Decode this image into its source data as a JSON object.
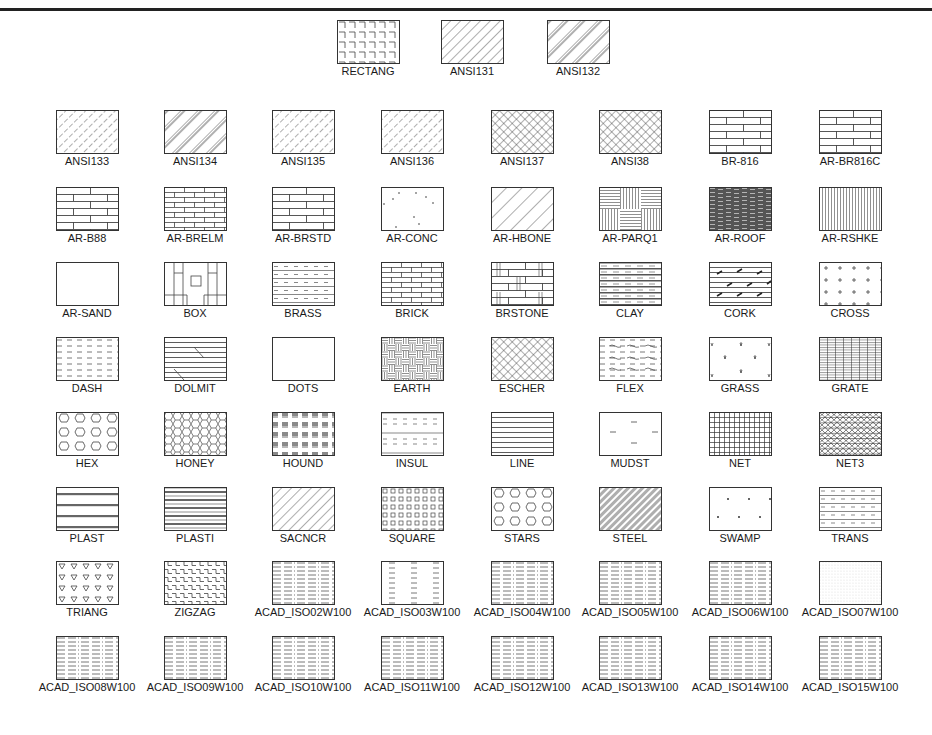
{
  "border_color": "#222222",
  "rows": [
    {
      "y": 20,
      "cells": [
        {
          "x": 337,
          "name": "RECTANG",
          "pattern": "rectang"
        },
        {
          "x": 441,
          "name": "ANSI131",
          "pattern": "ansi131"
        },
        {
          "x": 547,
          "name": "ANSI132",
          "pattern": "ansi132"
        }
      ]
    },
    {
      "y": 110,
      "cells": [
        {
          "name": "ANSI133",
          "pattern": "ansi133"
        },
        {
          "name": "ANSI134",
          "pattern": "ansi134"
        },
        {
          "name": "ANSI135",
          "pattern": "ansi135"
        },
        {
          "name": "ANSI136",
          "pattern": "ansi136"
        },
        {
          "name": "ANSI137",
          "pattern": "ansi137"
        },
        {
          "name": "ANSI38",
          "pattern": "ansi38"
        },
        {
          "name": "BR-816",
          "pattern": "br816"
        },
        {
          "name": "AR-BR816C",
          "pattern": "arbr816c"
        }
      ]
    },
    {
      "y": 187,
      "cells": [
        {
          "name": "AR-B88",
          "pattern": "arb88"
        },
        {
          "name": "AR-BRELM",
          "pattern": "arbrelm"
        },
        {
          "name": "AR-BRSTD",
          "pattern": "arbrstd"
        },
        {
          "name": "AR-CONC",
          "pattern": "arconc"
        },
        {
          "name": "AR-HBONE",
          "pattern": "arhbone"
        },
        {
          "name": "AR-PARQ1",
          "pattern": "arparq1"
        },
        {
          "name": "AR-ROOF",
          "pattern": "arroof"
        },
        {
          "name": "AR-RSHKE",
          "pattern": "arrshke"
        }
      ]
    },
    {
      "y": 262,
      "cells": [
        {
          "name": "AR-SAND",
          "pattern": "blank"
        },
        {
          "name": "BOX",
          "pattern": "box"
        },
        {
          "name": "BRASS",
          "pattern": "brass"
        },
        {
          "name": "BRICK",
          "pattern": "brick"
        },
        {
          "name": "BRSTONE",
          "pattern": "brstone"
        },
        {
          "name": "CLAY",
          "pattern": "clay"
        },
        {
          "name": "CORK",
          "pattern": "cork"
        },
        {
          "name": "CROSS",
          "pattern": "cross"
        }
      ]
    },
    {
      "y": 337,
      "cells": [
        {
          "name": "DASH",
          "pattern": "dash"
        },
        {
          "name": "DOLMIT",
          "pattern": "dolmit"
        },
        {
          "name": "DOTS",
          "pattern": "blank"
        },
        {
          "name": "EARTH",
          "pattern": "earth"
        },
        {
          "name": "ESCHER",
          "pattern": "escher"
        },
        {
          "name": "FLEX",
          "pattern": "flex"
        },
        {
          "name": "GRASS",
          "pattern": "grass"
        },
        {
          "name": "GRATE",
          "pattern": "grate"
        }
      ]
    },
    {
      "y": 412,
      "cells": [
        {
          "name": "HEX",
          "pattern": "hex"
        },
        {
          "name": "HONEY",
          "pattern": "honey"
        },
        {
          "name": "HOUND",
          "pattern": "hound"
        },
        {
          "name": "INSUL",
          "pattern": "insul"
        },
        {
          "name": "LINE",
          "pattern": "line"
        },
        {
          "name": "MUDST",
          "pattern": "mudst"
        },
        {
          "name": "NET",
          "pattern": "net"
        },
        {
          "name": "NET3",
          "pattern": "net3"
        }
      ]
    },
    {
      "y": 487,
      "cells": [
        {
          "name": "PLAST",
          "pattern": "plast"
        },
        {
          "name": "PLASTI",
          "pattern": "plasti"
        },
        {
          "name": "SACNCR",
          "pattern": "sacncr"
        },
        {
          "name": "SQUARE",
          "pattern": "square"
        },
        {
          "name": "STARS",
          "pattern": "stars"
        },
        {
          "name": "STEEL",
          "pattern": "steel"
        },
        {
          "name": "SWAMP",
          "pattern": "swamp"
        },
        {
          "name": "TRANS",
          "pattern": "trans"
        }
      ]
    },
    {
      "y": 561,
      "cells": [
        {
          "name": "TRIANG",
          "pattern": "triang"
        },
        {
          "name": "ZIGZAG",
          "pattern": "zigzag"
        },
        {
          "name": "ACAD_ISO02W100",
          "pattern": "iso"
        },
        {
          "name": "ACAD_ISO03W100",
          "pattern": "iso3"
        },
        {
          "name": "ACAD_ISO04W100",
          "pattern": "iso"
        },
        {
          "name": "ACAD_ISO05W100",
          "pattern": "iso"
        },
        {
          "name": "ACAD_ISO06W100",
          "pattern": "iso"
        },
        {
          "name": "ACAD_ISO07W100",
          "pattern": "iso7"
        }
      ]
    },
    {
      "y": 636,
      "cells": [
        {
          "name": "ACAD_ISO08W100",
          "pattern": "iso"
        },
        {
          "name": "ACAD_ISO09W100",
          "pattern": "iso"
        },
        {
          "name": "ACAD_ISO10W100",
          "pattern": "iso"
        },
        {
          "name": "ACAD_ISO11W100",
          "pattern": "iso"
        },
        {
          "name": "ACAD_ISO12W100",
          "pattern": "iso"
        },
        {
          "name": "ACAD_ISO13W100",
          "pattern": "iso"
        },
        {
          "name": "ACAD_ISO14W100",
          "pattern": "iso"
        },
        {
          "name": "ACAD_ISO15W100",
          "pattern": "iso"
        }
      ]
    }
  ],
  "column_x": [
    32,
    140,
    248,
    357,
    467,
    575,
    685,
    795
  ]
}
